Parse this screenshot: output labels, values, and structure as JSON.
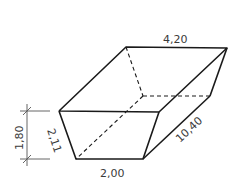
{
  "diagram": {
    "type": "trapezoidal-prism",
    "dimensions": {
      "top_width": "4,20",
      "bottom_width": "2,00",
      "length": "10,40",
      "slant_side": "2,11",
      "height": "1,80"
    },
    "colors": {
      "line": "#1a1a1a",
      "dim_line": "#555555",
      "text": "#3a3a3a"
    }
  }
}
